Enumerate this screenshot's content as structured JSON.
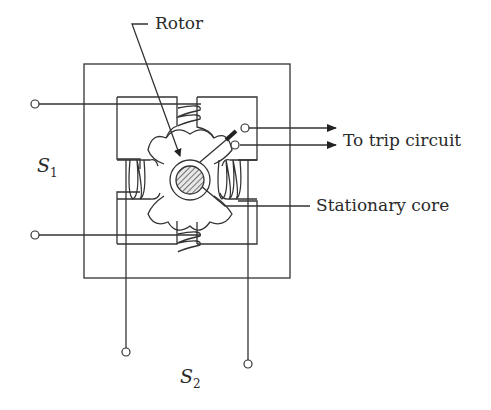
{
  "diagram": {
    "type": "induction-cup relay schematic",
    "labels": {
      "rotor": "Rotor",
      "trip": "To trip circuit",
      "stationary_core": "Stationary core",
      "s1_main": "S",
      "s1_sub": "1",
      "s2_main": "S",
      "s2_sub": "2"
    },
    "colors": {
      "line": "#333333",
      "background": "#ffffff",
      "hatch": "#555555"
    }
  }
}
